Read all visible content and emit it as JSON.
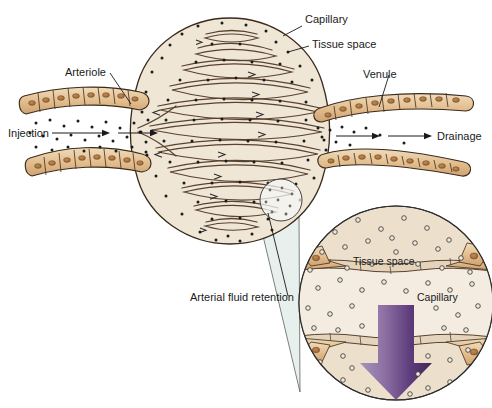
{
  "figure": {
    "domain": "Diagram",
    "background_color": "#ffffff",
    "width": 492,
    "height": 408
  },
  "labels": {
    "arteriole": "Arteriole",
    "injection": "Injection",
    "capillary": "Capillary",
    "tissue_space": "Tissue space",
    "venule": "Venule",
    "drainage": "Drainage",
    "arterial_fluid_retention": "Arterial fluid retention"
  },
  "inset": {
    "tissue_space": "Tissue space",
    "capillary": "Capillary",
    "arrow_direction": "down",
    "arrow_name": "fluid-flux-arrow"
  },
  "colors": {
    "tissue_bg": "#efe6d6",
    "inset_bg": "#ece0cd",
    "lumen": "#f4ece0",
    "cell_fill": "#e0bb8a",
    "cell_fill_light": "#ecd4ab",
    "nucleus": "#a8713c",
    "wall_outline": "#3a2a1c",
    "loop_stroke": "#5a4230",
    "dot": "#1b1b1b",
    "cone": "#dbe8e4",
    "arrow_purple_dark": "#4a2c63",
    "arrow_purple_light": "#b9a2c6",
    "text": "#1a1a1a"
  }
}
